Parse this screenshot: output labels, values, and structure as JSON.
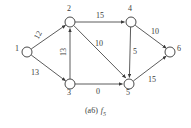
{
  "figure": {
    "caption_index": "(a6)",
    "caption_function": "f",
    "caption_subscript": "5",
    "width": 191,
    "height": 128,
    "stroke_color": "#4a4a4a",
    "text_color": "#3b3b3b",
    "background_color": "#ffffff"
  },
  "graph": {
    "type": "directed-flow-network",
    "nodes": [
      {
        "id": "1",
        "label": "1",
        "cx": 27,
        "cy": 52,
        "r": 5,
        "label_dx": -10,
        "label_dy": -4
      },
      {
        "id": "2",
        "label": "2",
        "cx": 70,
        "cy": 22,
        "r": 5,
        "label_dx": -2,
        "label_dy": -14
      },
      {
        "id": "3",
        "label": "3",
        "cx": 70,
        "cy": 84,
        "r": 5,
        "label_dx": -2,
        "label_dy": 5
      },
      {
        "id": "4",
        "label": "4",
        "cx": 131,
        "cy": 22,
        "r": 5,
        "label_dx": -2,
        "label_dy": -14
      },
      {
        "id": "5",
        "label": "5",
        "cx": 129,
        "cy": 84,
        "r": 5,
        "label_dx": -2,
        "label_dy": 5
      },
      {
        "id": "6",
        "label": "6",
        "cx": 170,
        "cy": 52,
        "r": 5,
        "label_dx": 6,
        "label_dy": -4
      }
    ],
    "edges": [
      {
        "from": "1",
        "to": "2",
        "label": "12",
        "label_x": 33,
        "label_y": 27,
        "rotated": true
      },
      {
        "from": "1",
        "to": "3",
        "label": "13",
        "label_x": 31,
        "label_y": 69,
        "rotated": false
      },
      {
        "from": "3",
        "to": "2",
        "label": "13",
        "label_x": 60,
        "label_y": 47,
        "rotated": true
      },
      {
        "from": "2",
        "to": "4",
        "label": "15",
        "label_x": 96,
        "label_y": 12,
        "rotated": false
      },
      {
        "from": "2",
        "to": "5",
        "label": "10",
        "label_x": 95,
        "label_y": 40,
        "rotated": false
      },
      {
        "from": "3",
        "to": "5",
        "label": "0",
        "label_x": 96,
        "label_y": 88,
        "rotated": false
      },
      {
        "from": "4",
        "to": "5",
        "label": "5",
        "label_x": 133,
        "label_y": 48,
        "rotated": false
      },
      {
        "from": "4",
        "to": "6",
        "label": "10",
        "label_x": 151,
        "label_y": 29,
        "rotated": false
      },
      {
        "from": "5",
        "to": "6",
        "label": "15",
        "label_x": 148,
        "label_y": 76,
        "rotated": false
      }
    ]
  }
}
